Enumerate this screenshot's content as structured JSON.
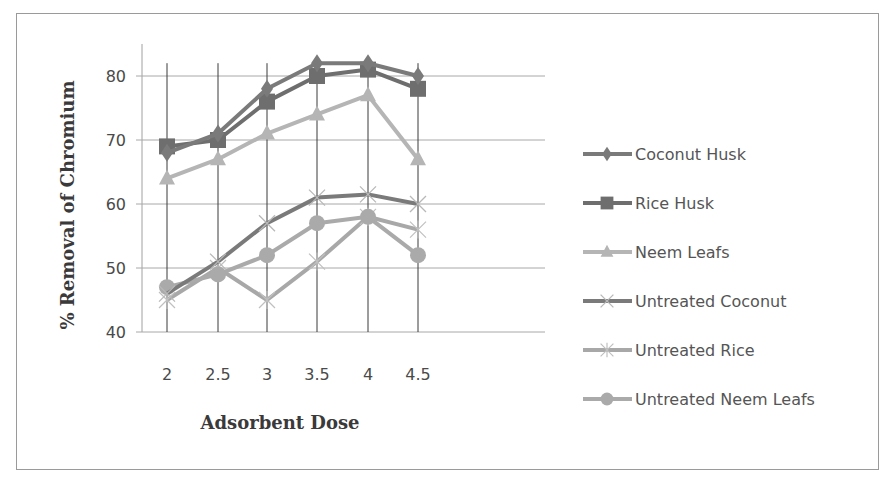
{
  "chart_data": {
    "type": "line",
    "title": "",
    "xlabel": "Adsorbent Dose",
    "ylabel": "% Removal of Chromium",
    "categories": [
      "2",
      "2.5",
      "3",
      "3.5",
      "4",
      "4.5"
    ],
    "ylim": [
      40,
      85
    ],
    "yticks": [
      "40",
      "50",
      "60",
      "70",
      "80"
    ],
    "grid": true,
    "legend_position": "right",
    "series": [
      {
        "name": "Coconut Husk",
        "marker": "diamond",
        "color": "#7a7a7a",
        "values": [
          68,
          71,
          78,
          82,
          82,
          80
        ]
      },
      {
        "name": "Rice Husk",
        "marker": "square",
        "color": "#6e6e6e",
        "values": [
          69,
          70,
          76,
          80,
          81,
          78
        ]
      },
      {
        "name": "Neem Leafs",
        "marker": "triangle",
        "color": "#b5b5b5",
        "values": [
          64,
          67,
          71,
          74,
          77,
          67
        ]
      },
      {
        "name": "Untreated Coconut",
        "marker": "x",
        "color": "#7a7a7a",
        "values": [
          46,
          51,
          57,
          61,
          61.5,
          60
        ]
      },
      {
        "name": "Untreated Rice",
        "marker": "star",
        "color": "#a8a8a8",
        "values": [
          45,
          50,
          45,
          51,
          58,
          56
        ]
      },
      {
        "name": "Untreated Neem Leafs",
        "marker": "circle",
        "color": "#aaaaaa",
        "values": [
          47,
          49,
          52,
          57,
          58,
          52
        ]
      }
    ]
  }
}
